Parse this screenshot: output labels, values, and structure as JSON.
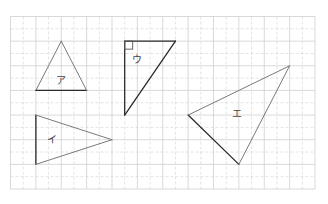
{
  "figure": {
    "grid": {
      "columns": 12,
      "rows": 7,
      "subdivided": true
    },
    "triangles": [
      {
        "id": "a",
        "label": "ア",
        "vertices": [
          [
            2,
            1
          ],
          [
            1,
            3
          ],
          [
            3,
            3
          ]
        ],
        "dark_edge": [
          1,
          2
        ],
        "right_angle": null
      },
      {
        "id": "u",
        "label": "ウ",
        "vertices": [
          [
            4.5,
            1
          ],
          [
            6.5,
            1
          ],
          [
            4.5,
            4
          ]
        ],
        "dark_edge": null,
        "dark_all": true,
        "right_angle": 0
      },
      {
        "id": "i",
        "label": "イ",
        "vertices": [
          [
            1,
            4
          ],
          [
            1,
            6
          ],
          [
            4,
            5
          ]
        ],
        "dark_edge": [
          0,
          1
        ],
        "right_angle": null
      },
      {
        "id": "e",
        "label": "エ",
        "vertices": [
          [
            7,
            4
          ],
          [
            9,
            6
          ],
          [
            11,
            2
          ]
        ],
        "dark_edge": [
          0,
          1
        ],
        "right_angle": null
      }
    ]
  }
}
